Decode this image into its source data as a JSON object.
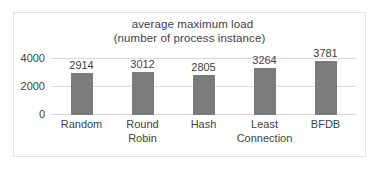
{
  "chart_data": {
    "type": "bar",
    "title": "average maximum load (number of process instance)",
    "title_line_1": "average maximum load",
    "title_line_2": "(number of process instance)",
    "categories": [
      "Random",
      "Round Robin",
      "Hash",
      "Least Connection",
      "BFDB"
    ],
    "values": [
      2914,
      3012,
      2805,
      3264,
      3781
    ],
    "value_labels": [
      "2914",
      "3012",
      "2805",
      "3264",
      "3781"
    ],
    "xlabel": "",
    "ylabel": "",
    "ylim": [
      0,
      4000
    ],
    "yticks": [
      0,
      2000,
      4000
    ],
    "ytick_labels": [
      "0",
      "2000",
      "4000"
    ],
    "grid": true,
    "legend": false,
    "series": [
      {
        "name": "average maximum load",
        "color": "#7b7b7b",
        "values": [
          2914,
          3012,
          2805,
          3264,
          3781
        ]
      }
    ],
    "category_lines": [
      [
        "Random"
      ],
      [
        "Round",
        "Robin"
      ],
      [
        "Hash"
      ],
      [
        "Least",
        "Connection"
      ],
      [
        "BFDB"
      ]
    ]
  },
  "colors": {
    "bar": "#7b7b7b",
    "gridline": "#d9d9d9",
    "text": "#3f3f3f",
    "border": "#e2e2e2",
    "background": "#ffffff"
  }
}
